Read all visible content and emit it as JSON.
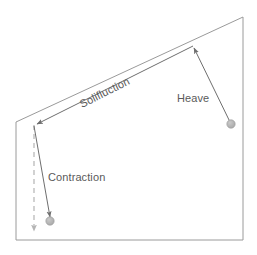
{
  "figure": {
    "background_color": "#ffffff",
    "width": 257,
    "height": 255
  },
  "colors": {
    "outline": "#9a9a9a",
    "arrow": "#6e6e6e",
    "dashed": "#b4b4b4",
    "text": "#5a5a5a",
    "ball_fill": "#b0b0b0",
    "ball_stroke": "#9a9a9a"
  },
  "labels": {
    "solifluction": "Solifluction",
    "heave": "Heave",
    "contraction": "Contraction"
  },
  "outline": {
    "name": "slope-cross-section",
    "points": "16,122 243,17 243,240 16,240"
  },
  "vectors": [
    {
      "name": "solifluction-vector",
      "label": "Solifluction",
      "from": {
        "x": 193,
        "y": 46
      },
      "to": {
        "x": 34,
        "y": 125
      },
      "style": "solid-arrow",
      "rotation_deg": -26.5
    },
    {
      "name": "heave-vector",
      "label": "Heave",
      "from": {
        "x": 231,
        "y": 124
      },
      "to": {
        "x": 193,
        "y": 46
      },
      "style": "solid-arrow"
    },
    {
      "name": "contraction-vector",
      "label": "Contraction",
      "from": {
        "x": 34,
        "y": 125
      },
      "to": {
        "x": 51,
        "y": 219
      },
      "style": "solid-arrow"
    },
    {
      "name": "vertical-reference-vector",
      "label": "",
      "from": {
        "x": 34,
        "y": 125
      },
      "to": {
        "x": 34,
        "y": 234
      },
      "style": "dashed-arrow"
    }
  ],
  "markers": [
    {
      "name": "heave-clast-marker",
      "x": 231,
      "y": 124,
      "r": 4
    },
    {
      "name": "contraction-clast-marker",
      "x": 50,
      "y": 221,
      "r": 4
    }
  ],
  "label_positions": {
    "solifluction": {
      "x": 82,
      "y": 108,
      "rotate": -26.5
    },
    "heave": {
      "x": 177,
      "y": 102
    },
    "contraction": {
      "x": 48,
      "y": 181
    }
  }
}
